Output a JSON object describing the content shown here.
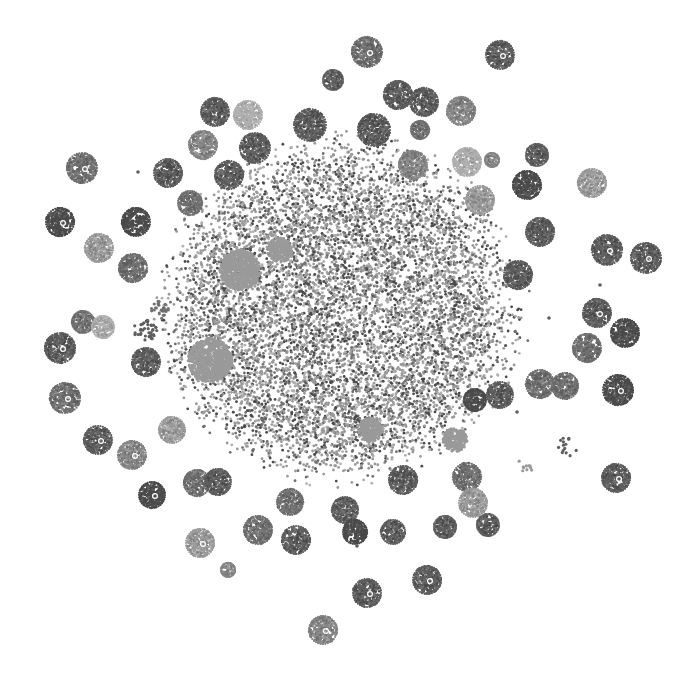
{
  "figure": {
    "title": "",
    "type": "network-cluster-visualization",
    "background": "#ffffff",
    "palette": [
      "#4a4a4a",
      "#5e5e5e",
      "#707070",
      "#858585",
      "#9a9a9a",
      "#b0b0b0"
    ]
  },
  "core": {
    "cx": 340,
    "cy": 310,
    "rx": 160,
    "ry": 150,
    "density": 9000,
    "light_patches": [
      {
        "x": 240,
        "y": 270,
        "r": 20
      },
      {
        "x": 210,
        "y": 360,
        "r": 22
      },
      {
        "x": 280,
        "y": 250,
        "r": 12
      },
      {
        "x": 370,
        "y": 430,
        "r": 12
      },
      {
        "x": 455,
        "y": 440,
        "r": 12
      }
    ]
  },
  "satellites": [
    {
      "x": 367,
      "y": 52,
      "r": 15,
      "shade": 2,
      "hub": true
    },
    {
      "x": 500,
      "y": 55,
      "r": 14,
      "shade": 1,
      "hub": true
    },
    {
      "x": 333,
      "y": 80,
      "r": 10,
      "shade": 1,
      "hub": false
    },
    {
      "x": 398,
      "y": 95,
      "r": 14,
      "shade": 1,
      "hub": false
    },
    {
      "x": 424,
      "y": 102,
      "r": 14,
      "shade": 1,
      "hub": false
    },
    {
      "x": 461,
      "y": 111,
      "r": 14,
      "shade": 3,
      "hub": false
    },
    {
      "x": 215,
      "y": 112,
      "r": 14,
      "shade": 1,
      "hub": false
    },
    {
      "x": 248,
      "y": 115,
      "r": 14,
      "shade": 5,
      "hub": false
    },
    {
      "x": 310,
      "y": 125,
      "r": 16,
      "shade": 1,
      "hub": false
    },
    {
      "x": 374,
      "y": 130,
      "r": 16,
      "shade": 1,
      "hub": false
    },
    {
      "x": 420,
      "y": 130,
      "r": 9,
      "shade": 2,
      "hub": false
    },
    {
      "x": 203,
      "y": 145,
      "r": 14,
      "shade": 3,
      "hub": false
    },
    {
      "x": 255,
      "y": 148,
      "r": 15,
      "shade": 1,
      "hub": false
    },
    {
      "x": 413,
      "y": 165,
      "r": 14,
      "shade": 3,
      "hub": false
    },
    {
      "x": 467,
      "y": 162,
      "r": 14,
      "shade": 5,
      "hub": false
    },
    {
      "x": 492,
      "y": 160,
      "r": 7,
      "shade": 3,
      "hub": false
    },
    {
      "x": 537,
      "y": 155,
      "r": 11,
      "shade": 1,
      "hub": false
    },
    {
      "x": 82,
      "y": 168,
      "r": 15,
      "shade": 2,
      "hub": true
    },
    {
      "x": 168,
      "y": 173,
      "r": 14,
      "shade": 1,
      "hub": false
    },
    {
      "x": 229,
      "y": 175,
      "r": 14,
      "shade": 1,
      "hub": false
    },
    {
      "x": 527,
      "y": 185,
      "r": 14,
      "shade": 0,
      "hub": false
    },
    {
      "x": 592,
      "y": 183,
      "r": 14,
      "shade": 4,
      "hub": false
    },
    {
      "x": 190,
      "y": 203,
      "r": 12,
      "shade": 2,
      "hub": false
    },
    {
      "x": 480,
      "y": 200,
      "r": 14,
      "shade": 4,
      "hub": false
    },
    {
      "x": 60,
      "y": 222,
      "r": 14,
      "shade": 0,
      "hub": true
    },
    {
      "x": 136,
      "y": 222,
      "r": 14,
      "shade": 0,
      "hub": false
    },
    {
      "x": 540,
      "y": 232,
      "r": 14,
      "shade": 1,
      "hub": false
    },
    {
      "x": 99,
      "y": 248,
      "r": 14,
      "shade": 4,
      "hub": false
    },
    {
      "x": 133,
      "y": 268,
      "r": 14,
      "shade": 2,
      "hub": false
    },
    {
      "x": 607,
      "y": 250,
      "r": 15,
      "shade": 1,
      "hub": true
    },
    {
      "x": 646,
      "y": 258,
      "r": 15,
      "shade": 1,
      "hub": true
    },
    {
      "x": 518,
      "y": 275,
      "r": 14,
      "shade": 1,
      "hub": false
    },
    {
      "x": 83,
      "y": 322,
      "r": 11,
      "shade": 2,
      "hub": false
    },
    {
      "x": 103,
      "y": 327,
      "r": 11,
      "shade": 5,
      "hub": false
    },
    {
      "x": 597,
      "y": 313,
      "r": 14,
      "shade": 1,
      "hub": true
    },
    {
      "x": 625,
      "y": 333,
      "r": 14,
      "shade": 0,
      "hub": false
    },
    {
      "x": 60,
      "y": 348,
      "r": 15,
      "shade": 1,
      "hub": true
    },
    {
      "x": 587,
      "y": 348,
      "r": 14,
      "shade": 2,
      "hub": false
    },
    {
      "x": 146,
      "y": 362,
      "r": 14,
      "shade": 1,
      "hub": false
    },
    {
      "x": 65,
      "y": 398,
      "r": 15,
      "shade": 2,
      "hub": true
    },
    {
      "x": 540,
      "y": 384,
      "r": 14,
      "shade": 2,
      "hub": false
    },
    {
      "x": 565,
      "y": 386,
      "r": 13,
      "shade": 2,
      "hub": false
    },
    {
      "x": 618,
      "y": 390,
      "r": 15,
      "shade": 0,
      "hub": true
    },
    {
      "x": 98,
      "y": 440,
      "r": 14,
      "shade": 1,
      "hub": true
    },
    {
      "x": 132,
      "y": 455,
      "r": 14,
      "shade": 3,
      "hub": true
    },
    {
      "x": 172,
      "y": 430,
      "r": 13,
      "shade": 4,
      "hub": false
    },
    {
      "x": 152,
      "y": 495,
      "r": 13,
      "shade": 0,
      "hub": true
    },
    {
      "x": 197,
      "y": 483,
      "r": 13,
      "shade": 2,
      "hub": false
    },
    {
      "x": 218,
      "y": 482,
      "r": 13,
      "shade": 1,
      "hub": false
    },
    {
      "x": 290,
      "y": 502,
      "r": 13,
      "shade": 2,
      "hub": false
    },
    {
      "x": 345,
      "y": 510,
      "r": 13,
      "shade": 1,
      "hub": false
    },
    {
      "x": 393,
      "y": 532,
      "r": 12,
      "shade": 1,
      "hub": false
    },
    {
      "x": 445,
      "y": 527,
      "r": 11,
      "shade": 1,
      "hub": false
    },
    {
      "x": 488,
      "y": 525,
      "r": 11,
      "shade": 1,
      "hub": false
    },
    {
      "x": 258,
      "y": 530,
      "r": 14,
      "shade": 2,
      "hub": false
    },
    {
      "x": 296,
      "y": 540,
      "r": 14,
      "shade": 1,
      "hub": false
    },
    {
      "x": 200,
      "y": 543,
      "r": 14,
      "shade": 4,
      "hub": true
    },
    {
      "x": 355,
      "y": 532,
      "r": 12,
      "shade": 0,
      "hub": false
    },
    {
      "x": 228,
      "y": 570,
      "r": 7,
      "shade": 3,
      "hub": false
    },
    {
      "x": 427,
      "y": 580,
      "r": 14,
      "shade": 1,
      "hub": true
    },
    {
      "x": 367,
      "y": 593,
      "r": 14,
      "shade": 1,
      "hub": true
    },
    {
      "x": 323,
      "y": 630,
      "r": 14,
      "shade": 3,
      "hub": true
    },
    {
      "x": 467,
      "y": 477,
      "r": 14,
      "shade": 2,
      "hub": false
    },
    {
      "x": 403,
      "y": 480,
      "r": 14,
      "shade": 1,
      "hub": false
    },
    {
      "x": 473,
      "y": 503,
      "r": 14,
      "shade": 4,
      "hub": false
    },
    {
      "x": 616,
      "y": 478,
      "r": 14,
      "shade": 1,
      "hub": true
    },
    {
      "x": 500,
      "y": 395,
      "r": 13,
      "shade": 1,
      "hub": false
    },
    {
      "x": 475,
      "y": 400,
      "r": 11,
      "shade": 0,
      "hub": false
    }
  ],
  "loose_groups": [
    {
      "x": 567,
      "y": 447,
      "r": 10,
      "count": 14,
      "shade": 1
    },
    {
      "x": 526,
      "y": 462,
      "r": 10,
      "count": 10,
      "shade": 4
    },
    {
      "x": 145,
      "y": 332,
      "r": 12,
      "count": 40,
      "shade": 1
    },
    {
      "x": 160,
      "y": 310,
      "r": 9,
      "count": 25,
      "shade": 2
    }
  ],
  "stray_points": [
    {
      "x": 138,
      "y": 172
    },
    {
      "x": 511,
      "y": 369
    },
    {
      "x": 600,
      "y": 285
    },
    {
      "x": 517,
      "y": 412
    },
    {
      "x": 357,
      "y": 546
    },
    {
      "x": 549,
      "y": 318
    }
  ]
}
